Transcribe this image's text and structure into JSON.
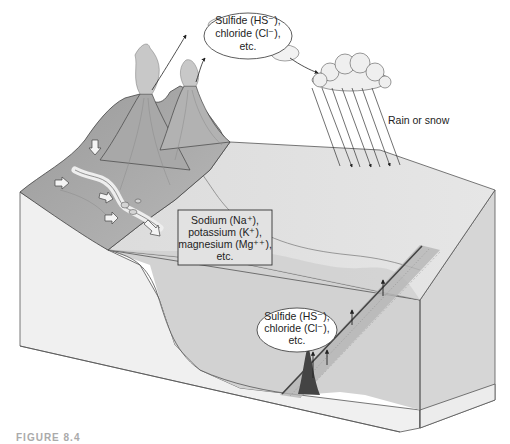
{
  "diagram": {
    "labels": {
      "atmosphere_ions": [
        "Sulfide (HS⁻),",
        "chloride (Cl⁻),",
        "etc."
      ],
      "precipitation": "Rain or snow",
      "river_ions": [
        "Sodium (Na⁺),",
        "potassium (K⁺),",
        "magnesium (Mg⁺⁺),",
        "etc."
      ],
      "vent_ions": [
        "Sulfide (HS⁻),",
        "chloride (Cl⁻),",
        "etc."
      ]
    },
    "caption": "FIGURE 8.4"
  }
}
